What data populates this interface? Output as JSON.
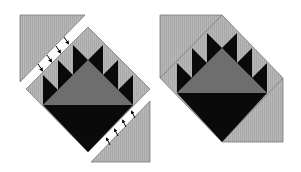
{
  "diagram": {
    "title": "",
    "colors": {
      "background": "#ffffff",
      "light_fabric": "#b5b5b5",
      "medium_fabric": "#6e6e6e",
      "dark_fabric": "#0a0a0a",
      "outline": "#7a7a7a",
      "arrow": "#000000"
    },
    "panels": [
      {
        "id": "exploded-view",
        "label": ""
      },
      {
        "id": "assembled-view",
        "label": ""
      }
    ],
    "arrows": {
      "top_count": 4,
      "bottom_count": 4,
      "top_direction": "down-right",
      "bottom_direction": "up-left"
    }
  }
}
